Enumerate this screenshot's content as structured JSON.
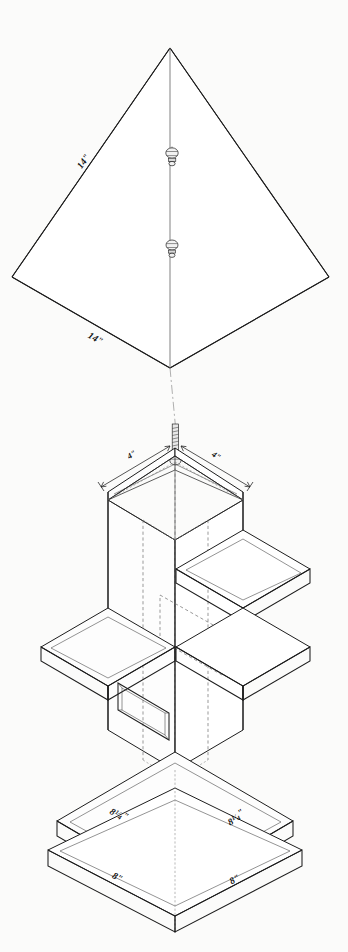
{
  "drawing": {
    "title": "Cupola Exploded Isometric Detail",
    "sheet_background": "#fbfbfa",
    "line_color": "#1d1d1d",
    "hidden_line_color": "#6d6d6d",
    "width_px": 348,
    "height_px": 952
  },
  "views": {
    "roof_development": {
      "name": "Pyramidal Roof Development",
      "shape": "four-sided pyramid developed / plan diamond",
      "dimensions": [
        {
          "id": "roof-left-slope",
          "value": "14\"",
          "whole": "14",
          "unit": "\""
        },
        {
          "id": "roof-lower-left-edge",
          "value": "14\"",
          "whole": "14",
          "unit": "\""
        }
      ],
      "hardware": [
        {
          "id": "finial-nut-upper",
          "type": "ball-nut-finial"
        },
        {
          "id": "finial-nut-lower",
          "type": "ball-nut-finial"
        }
      ]
    },
    "cupola_assembly": {
      "name": "Cupola Exploded Assembly",
      "parts": [
        {
          "id": "roof-cap",
          "label": "Roof Cap"
        },
        {
          "id": "tower-body",
          "label": "Tower Body"
        },
        {
          "id": "upper-collar",
          "label": "Upper Collar"
        },
        {
          "id": "lower-collar",
          "label": "Lower Collar"
        },
        {
          "id": "base-plinth-upper",
          "label": "Upper Base Plate"
        },
        {
          "id": "base-plinth-lower",
          "label": "Lower Base Plate"
        },
        {
          "id": "vent-opening",
          "label": "Vent Opening"
        },
        {
          "id": "threaded-rod",
          "label": "Threaded Rod"
        }
      ],
      "dimensions": [
        {
          "id": "cap-left",
          "value": "4\"",
          "whole": "4",
          "unit": "\""
        },
        {
          "id": "cap-right",
          "value": "4\"",
          "whole": "4",
          "unit": "\""
        },
        {
          "id": "base-upper-left",
          "whole": "8",
          "num": "1",
          "den": "4",
          "unit": "\"",
          "value": "8 1/4\""
        },
        {
          "id": "base-upper-right",
          "whole": "8",
          "num": "1",
          "den": "4",
          "unit": "\"",
          "value": "8 1/4\""
        },
        {
          "id": "base-lower-left",
          "whole": "8",
          "unit": "\"",
          "value": "8\""
        },
        {
          "id": "base-lower-right",
          "whole": "8",
          "unit": "\"",
          "value": "8\""
        }
      ]
    }
  }
}
